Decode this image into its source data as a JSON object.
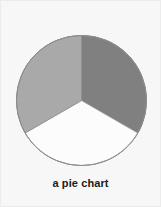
{
  "figure": {
    "caption": "a pie chart",
    "background_color": "#f7f7f7",
    "border_color": "#ececec"
  },
  "chart_data": {
    "type": "pie",
    "title": "a pie chart",
    "xlabel": "",
    "ylabel": "",
    "grid": false,
    "legend": false,
    "legend_position": "none",
    "start_angle_deg": 0,
    "direction": "clockwise",
    "center_px": [
      80,
      99.5
    ],
    "radius_px": 65,
    "outline_color": "#8c8c8c",
    "labels": [
      "slice-1",
      "slice-2",
      "slice-3"
    ],
    "values": [
      33.3,
      33.3,
      33.3
    ],
    "angles_deg": [
      120,
      120,
      120
    ],
    "colors": [
      "#808080",
      "#fcfcfc",
      "#a9a9a9"
    ],
    "slices": [
      {
        "name": "slice-1",
        "value": 33.3,
        "angle_deg": 120,
        "start_deg": 0,
        "end_deg": 120,
        "color": "#808080",
        "position": "right"
      },
      {
        "name": "slice-2",
        "value": 33.3,
        "angle_deg": 120,
        "start_deg": 120,
        "end_deg": 240,
        "color": "#fcfcfc",
        "position": "bottom"
      },
      {
        "name": "slice-3",
        "value": 33.3,
        "angle_deg": 120,
        "start_deg": 240,
        "end_deg": 360,
        "color": "#a9a9a9",
        "position": "left"
      }
    ]
  }
}
